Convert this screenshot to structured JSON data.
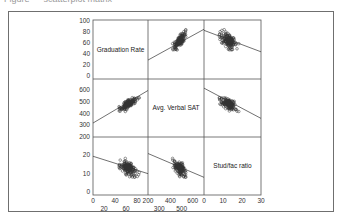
{
  "caption_fragment": "Figure — scatterplot matrix",
  "chart_data": {
    "type": "scatter",
    "subtype": "scatterplot-matrix",
    "variables": [
      "Graduation Rate",
      "Avg. Verbal SAT",
      "Stud/fac ratio"
    ],
    "ranges": {
      "Graduation Rate": [
        0,
        100
      ],
      "Avg. Verbal SAT": [
        200,
        700
      ],
      "Stud/fac ratio": [
        0,
        30
      ]
    },
    "left_ticks": {
      "Graduation Rate": [
        "100",
        "80",
        "60",
        "40",
        "20",
        "0"
      ],
      "Avg. Verbal SAT": [
        "600",
        "500",
        "400",
        "300",
        "200"
      ],
      "Stud/fac ratio": [
        "20",
        "10",
        "0"
      ]
    },
    "bottom_ticks_upper": {
      "Graduation Rate": [
        "0",
        "40",
        "80"
      ],
      "Avg. Verbal SAT": [
        "200",
        "400",
        "600"
      ],
      "Stud/fac ratio": [
        "0",
        "10",
        "20",
        "30"
      ]
    },
    "bottom_ticks_lower": {
      "Graduation Rate": [
        "20",
        "60"
      ],
      "Avg. Verbal SAT": [
        "300",
        "500"
      ]
    },
    "fit_lines": {
      "grad_vs_sat": {
        "x": [
          200,
          700
        ],
        "y": [
          29,
          85
        ]
      },
      "grad_vs_sf": {
        "x": [
          0,
          30
        ],
        "y": [
          83,
          44
        ]
      },
      "sat_vs_grad": {
        "x": [
          0,
          100
        ],
        "y": [
          320,
          600
        ]
      },
      "sat_vs_sf": {
        "x": [
          0,
          30
        ],
        "y": [
          620,
          360
        ]
      },
      "sf_vs_grad": {
        "x": [
          0,
          100
        ],
        "y": [
          19.5,
          10
        ]
      },
      "sf_vs_sat": {
        "x": [
          200,
          700
        ],
        "y": [
          21,
          8
        ]
      }
    },
    "n_points": 150,
    "grid": true,
    "legend": "none"
  },
  "style": {
    "point_stroke": "#333333",
    "line_color": "#333333",
    "grid_color": "#555555",
    "frame_color": "#6f6f6f"
  }
}
